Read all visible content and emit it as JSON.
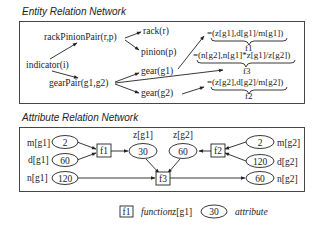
{
  "entity_network": {
    "title": "Entity Relation Network",
    "nodes": {
      "indicator": "indicator(i)",
      "rackPinionPair": "rackPinionPair(r,p)",
      "rack": "rack(r)",
      "pinion": "pinion(p)",
      "gearPair": "gearPair(g1,g2)",
      "gear1": "gear(g1)",
      "gear2": "gear(g2)"
    },
    "formulas": {
      "f1": {
        "expr": "=(z[g1],d[g1]/m[g1])",
        "label": "f1"
      },
      "f3": {
        "expr": "=(n[g2],n[g1]*z[g1]/z[g2])",
        "label": "f3"
      },
      "f2": {
        "expr": "=(z[g2],d[g2]/m[g2])",
        "label": "f2"
      }
    }
  },
  "attribute_network": {
    "title": "Attribute Relation Network",
    "attributes": {
      "m_g1": {
        "name": "m[g1]",
        "value": "2"
      },
      "d_g1": {
        "name": "d[g1]",
        "value": "60"
      },
      "n_g1": {
        "name": "n[g1]",
        "value": "120"
      },
      "z_g1": {
        "name": "z[g1]",
        "value": "30"
      },
      "z_g2": {
        "name": "z[g2]",
        "value": "60"
      },
      "m_g2": {
        "name": "m[g2]",
        "value": "2"
      },
      "d_g2": {
        "name": "d[g2]",
        "value": "120"
      },
      "n_g2": {
        "name": "n[g2]",
        "value": "60"
      }
    },
    "functions": {
      "f1": "f1",
      "f2": "f2",
      "f3": "f3"
    }
  },
  "legend": {
    "function_box": "f1",
    "function_label": "function",
    "attribute_name": "z[g1]",
    "attribute_value": "30",
    "attribute_label": "attribute"
  }
}
